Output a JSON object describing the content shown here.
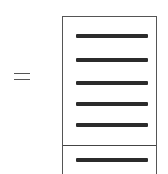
{
  "toggle": {
    "icon": "equals-icon",
    "glyph": "="
  },
  "panel": {
    "items": [
      {
        "icon": "bar-icon"
      },
      {
        "icon": "bar-icon"
      },
      {
        "icon": "bar-icon"
      },
      {
        "icon": "bar-icon"
      },
      {
        "icon": "bar-icon"
      }
    ],
    "footer_items": [
      {
        "icon": "bar-icon"
      }
    ]
  },
  "colors": {
    "bar": "#2b2b2b",
    "border": "#555555",
    "background": "#ffffff"
  }
}
